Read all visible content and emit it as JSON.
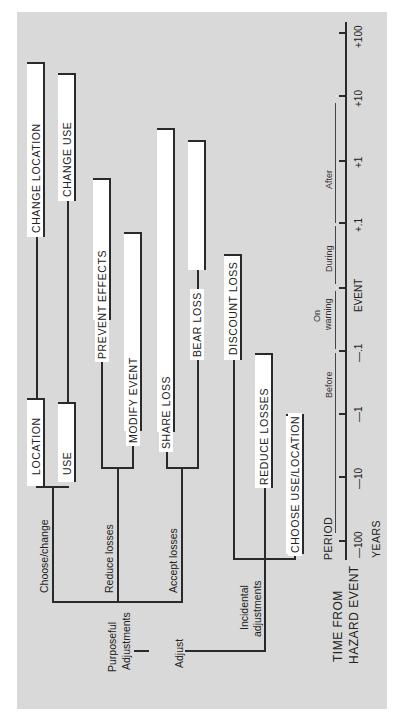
{
  "diagram": {
    "orientation": "rotated-90-ccw",
    "root": {
      "label": "Adjust",
      "children": [
        {
          "label": "Purposeful Adjustments",
          "children": [
            {
              "label": "Choose/change",
              "children": [
                {
                  "label": "LOCATION",
                  "next": "CHANGE LOCATION"
                },
                {
                  "label": "USE",
                  "next": "CHANGE USE"
                }
              ]
            },
            {
              "label": "Reduce losses",
              "children": [
                {
                  "label": "PREVENT EFFECTS"
                },
                {
                  "label": "MODIFY EVENT"
                }
              ]
            },
            {
              "label": "Accept losses",
              "children": [
                {
                  "label": "SHARE LOSS"
                },
                {
                  "label": "BEAR LOSS"
                }
              ]
            }
          ]
        },
        {
          "label": "Incidental adjustments",
          "children": [
            {
              "label": "DISCOUNT LOSS"
            },
            {
              "label": "REDUCE LOSSES"
            },
            {
              "label": "CHOOSE USE/LOCATION"
            }
          ]
        }
      ]
    },
    "boxes": {
      "location": "LOCATION",
      "change_location": "CHANGE LOCATION",
      "use": "USE",
      "change_use": "CHANGE USE",
      "prevent_effects": "PREVENT EFFECTS",
      "modify_event": "MODIFY EVENT",
      "share_loss": "SHARE LOSS",
      "bear_loss": "BEAR LOSS",
      "discount_loss": "DISCOUNT LOSS",
      "reduce_losses": "REDUCE LOSSES",
      "choose_use_location": "CHOOSE USE/LOCATION"
    },
    "branch_labels": {
      "choose_change": "Choose/change",
      "reduce_losses": "Reduce losses",
      "accept_losses": "Accept losses",
      "purposeful_1": "Purposeful",
      "purposeful_2": "Adjustments",
      "adjust": "Adjust",
      "incidental_1": "Incidental",
      "incidental_2": "adjustments"
    },
    "timeline": {
      "axis_title_1": "TIME FROM",
      "axis_title_2": "HAZARD EVENT",
      "period_label": "PERIOD",
      "units": "YEARS",
      "ticks": [
        "-100",
        "-10",
        "-1",
        "-.1",
        "EVENT",
        "+.1",
        "+1",
        "+10",
        "+100"
      ],
      "tick_labels": {
        "m100": "—100",
        "m10": "—10",
        "m1": "—1",
        "m01": "—.1",
        "event": "EVENT",
        "p01": "+.1",
        "p1": "+1",
        "p10": "+10",
        "p100": "+100"
      },
      "periods": {
        "before": "Before",
        "on_warning_1": "On",
        "on_warning_2": "warning",
        "during": "During",
        "after": "After"
      }
    }
  }
}
